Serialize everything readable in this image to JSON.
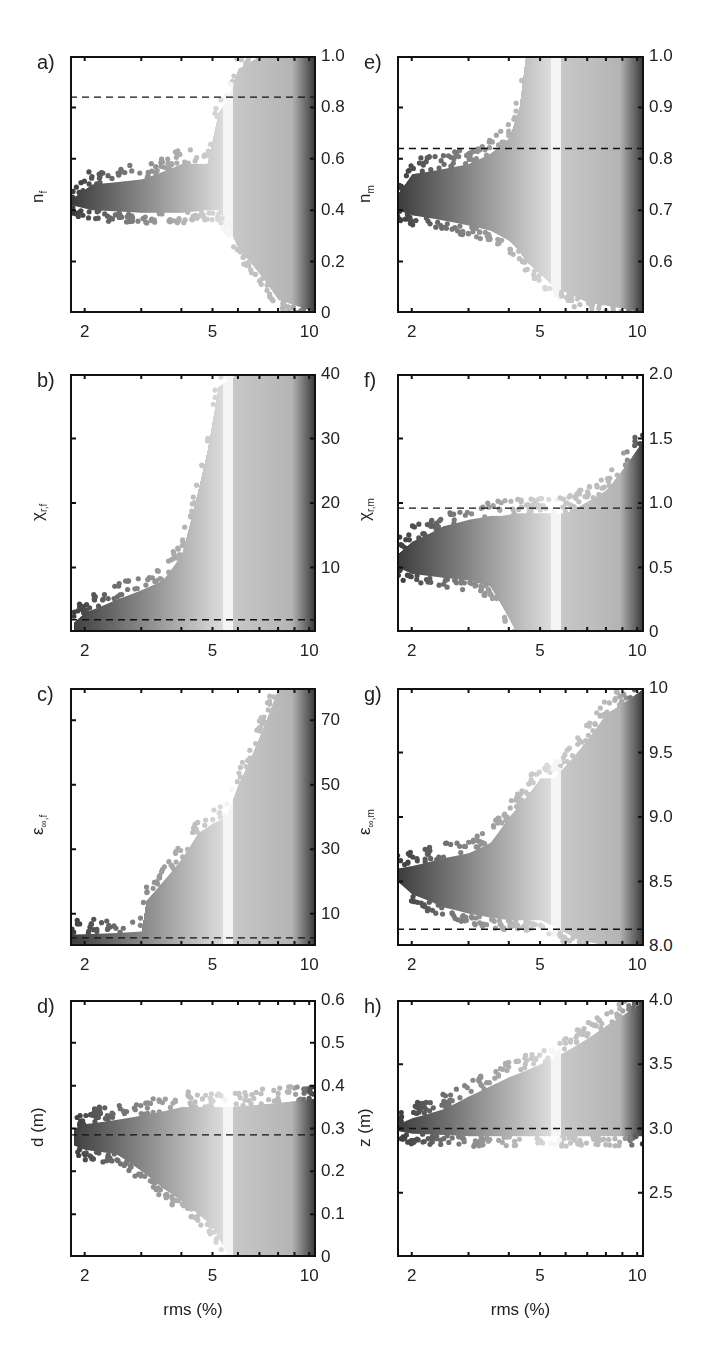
{
  "figure": {
    "xlabel": "rms (%)",
    "x_scale": "log",
    "x_range": [
      1.8,
      10.5
    ],
    "x_ticks": [
      2,
      5,
      10
    ],
    "x_minor_ticks": [
      3,
      4,
      6,
      7,
      8,
      9
    ]
  },
  "chart_data": [
    {
      "id": "a",
      "panel_label": "a)",
      "type": "scatter",
      "ylabel": "n",
      "ylabel_sub": "f",
      "ylim": [
        0,
        1.0
      ],
      "yticks": [
        0,
        0.2,
        0.4,
        0.6,
        0.8,
        1.0
      ],
      "ytick_labels": [
        "0",
        "0.2",
        "0.4",
        "0.6",
        "0.8",
        "1.0"
      ],
      "reference_line": 0.84,
      "xtick_labels": [
        "2",
        "5",
        "10"
      ],
      "envelope": [
        [
          1.8,
          0.42,
          0.44
        ],
        [
          2.1,
          0.4,
          0.5
        ],
        [
          3.0,
          0.39,
          0.52
        ],
        [
          4.0,
          0.39,
          0.58
        ],
        [
          4.8,
          0.4,
          0.58
        ],
        [
          5.2,
          0.4,
          0.78
        ],
        [
          5.5,
          0.35,
          0.82
        ],
        [
          6.0,
          0.25,
          0.95
        ],
        [
          7.0,
          0.15,
          1.0
        ],
        [
          8.0,
          0.05,
          1.0
        ],
        [
          10.5,
          0.0,
          1.0
        ]
      ]
    },
    {
      "id": "b",
      "panel_label": "b)",
      "type": "scatter",
      "ylabel": "χ",
      "ylabel_sub": "r,f",
      "ylim": [
        0,
        40
      ],
      "yticks": [
        10,
        20,
        30,
        40
      ],
      "ytick_labels": [
        "10",
        "20",
        "30",
        "40"
      ],
      "reference_line": 1.9,
      "xtick_labels": [
        "2",
        "5",
        "10"
      ],
      "envelope": [
        [
          1.85,
          0,
          1.5
        ],
        [
          2.0,
          0,
          3
        ],
        [
          2.5,
          0,
          5
        ],
        [
          3.0,
          0,
          6.5
        ],
        [
          3.5,
          0,
          8
        ],
        [
          4.0,
          0,
          12
        ],
        [
          4.3,
          0,
          18
        ],
        [
          4.5,
          0,
          22
        ],
        [
          4.8,
          0,
          28
        ],
        [
          5.2,
          0,
          38
        ],
        [
          6.0,
          0,
          40
        ],
        [
          10.5,
          0,
          40
        ]
      ]
    },
    {
      "id": "c",
      "panel_label": "c)",
      "type": "scatter",
      "ylabel": "ε",
      "ylabel_sub": "∞,f",
      "ylim": [
        0,
        80
      ],
      "yticks": [
        10,
        30,
        50,
        70
      ],
      "ytick_labels": [
        "10",
        "30",
        "50",
        "70"
      ],
      "reference_line": 2.5,
      "xtick_labels": [
        "2",
        "5",
        "10"
      ],
      "envelope": [
        [
          1.8,
          0,
          3.5
        ],
        [
          2.5,
          0,
          4
        ],
        [
          3.0,
          0,
          4.5
        ],
        [
          3.1,
          0,
          14
        ],
        [
          3.5,
          0,
          20
        ],
        [
          4.0,
          0,
          27
        ],
        [
          4.5,
          0,
          35
        ],
        [
          5.0,
          0,
          38
        ],
        [
          5.5,
          0,
          40
        ],
        [
          6.0,
          0,
          50
        ],
        [
          7.0,
          0,
          65
        ],
        [
          8.0,
          0,
          80
        ],
        [
          10.5,
          0,
          80
        ]
      ]
    },
    {
      "id": "d",
      "panel_label": "d)",
      "type": "scatter",
      "ylabel": "d (m)",
      "ylabel_sub": "",
      "ylim": [
        0,
        0.6
      ],
      "yticks": [
        0,
        0.1,
        0.2,
        0.3,
        0.4,
        0.5,
        0.6
      ],
      "ytick_labels": [
        "0",
        "0.1",
        "0.2",
        "0.3",
        "0.4",
        "0.5",
        "0.6"
      ],
      "reference_line": 0.285,
      "xtick_labels": [
        "2",
        "5",
        "10"
      ],
      "envelope": [
        [
          1.85,
          0.26,
          0.3
        ],
        [
          2.0,
          0.25,
          0.31
        ],
        [
          2.5,
          0.24,
          0.32
        ],
        [
          3.0,
          0.2,
          0.33
        ],
        [
          3.5,
          0.16,
          0.34
        ],
        [
          4.0,
          0.13,
          0.35
        ],
        [
          5.0,
          0.07,
          0.35
        ],
        [
          5.6,
          0.0,
          0.35
        ],
        [
          10.5,
          0.0,
          0.37
        ]
      ]
    },
    {
      "id": "e",
      "panel_label": "e)",
      "type": "scatter",
      "ylabel": "n",
      "ylabel_sub": "m",
      "ylim": [
        0.5,
        1.0
      ],
      "yticks": [
        0.6,
        0.7,
        0.8,
        0.9,
        1.0
      ],
      "ytick_labels": [
        "0.6",
        "0.7",
        "0.8",
        "0.9",
        "1.0"
      ],
      "reference_line": 0.82,
      "xtick_labels": [
        "2",
        "5",
        "10"
      ],
      "envelope": [
        [
          1.8,
          0.7,
          0.73
        ],
        [
          2.0,
          0.69,
          0.77
        ],
        [
          2.5,
          0.68,
          0.78
        ],
        [
          3.0,
          0.67,
          0.79
        ],
        [
          3.5,
          0.66,
          0.81
        ],
        [
          4.0,
          0.64,
          0.84
        ],
        [
          4.3,
          0.62,
          0.9
        ],
        [
          4.5,
          0.6,
          1.0
        ],
        [
          5.5,
          0.55,
          1.0
        ],
        [
          7.0,
          0.52,
          1.0
        ],
        [
          10.5,
          0.5,
          1.0
        ]
      ]
    },
    {
      "id": "f",
      "panel_label": "f)",
      "type": "scatter",
      "ylabel": "χ",
      "ylabel_sub": "r,m",
      "ylim": [
        0,
        2.0
      ],
      "yticks": [
        0,
        0.5,
        1.0,
        1.5,
        2.0
      ],
      "ytick_labels": [
        "0",
        "0.5",
        "1.0",
        "1.5",
        "2.0"
      ],
      "reference_line": 0.96,
      "xtick_labels": [
        "2",
        "5",
        "10"
      ],
      "envelope": [
        [
          1.8,
          0.5,
          0.6
        ],
        [
          2.0,
          0.45,
          0.7
        ],
        [
          2.5,
          0.42,
          0.82
        ],
        [
          3.0,
          0.4,
          0.87
        ],
        [
          3.5,
          0.35,
          0.9
        ],
        [
          3.8,
          0.2,
          0.9
        ],
        [
          4.2,
          0.0,
          0.92
        ],
        [
          6.0,
          0.0,
          0.92
        ],
        [
          8.0,
          0.0,
          1.1
        ],
        [
          10.5,
          0.0,
          1.5
        ]
      ]
    },
    {
      "id": "g",
      "panel_label": "g)",
      "type": "scatter",
      "ylabel": "ε",
      "ylabel_sub": "∞,m",
      "ylim": [
        8.0,
        10.0
      ],
      "yticks": [
        8.0,
        8.5,
        9.0,
        9.5,
        10
      ],
      "ytick_labels": [
        "8.0",
        "8.5",
        "9.0",
        "9.5",
        "10"
      ],
      "reference_line": 8.13,
      "xtick_labels": [
        "2",
        "5",
        "10"
      ],
      "envelope": [
        [
          1.8,
          8.5,
          8.6
        ],
        [
          2.0,
          8.4,
          8.62
        ],
        [
          2.5,
          8.3,
          8.68
        ],
        [
          3.0,
          8.25,
          8.72
        ],
        [
          3.5,
          8.22,
          8.8
        ],
        [
          4.0,
          8.2,
          9.0
        ],
        [
          4.5,
          8.2,
          9.15
        ],
        [
          5.0,
          8.2,
          9.3
        ],
        [
          5.5,
          8.15,
          9.3
        ],
        [
          6.5,
          8.05,
          9.5
        ],
        [
          8.0,
          8.0,
          9.8
        ],
        [
          10.5,
          8.0,
          10.0
        ]
      ]
    },
    {
      "id": "h",
      "panel_label": "h)",
      "type": "scatter",
      "ylabel": "z (m)",
      "ylabel_sub": "",
      "ylim": [
        2.0,
        4.0
      ],
      "yticks": [
        2.5,
        3.0,
        3.5,
        4.0
      ],
      "ytick_labels": [
        "2.5",
        "3.0",
        "3.5",
        "4.0"
      ],
      "reference_line": 3.0,
      "xtick_labels": [
        "2",
        "5",
        "10"
      ],
      "xlabel": "rms (%)",
      "envelope": [
        [
          1.8,
          2.98,
          3.03
        ],
        [
          2.0,
          2.96,
          3.08
        ],
        [
          2.5,
          2.95,
          3.15
        ],
        [
          3.0,
          2.94,
          3.25
        ],
        [
          3.5,
          2.94,
          3.33
        ],
        [
          4.0,
          2.94,
          3.4
        ],
        [
          5.0,
          2.94,
          3.5
        ],
        [
          6.0,
          2.94,
          3.6
        ],
        [
          7.0,
          2.94,
          3.7
        ],
        [
          8.0,
          2.94,
          3.8
        ],
        [
          10.5,
          2.94,
          4.0
        ]
      ]
    }
  ],
  "style": {
    "dark_gray": "#3a3a3a",
    "light_gray": "#f4f4f4",
    "frame_color": "#111111",
    "dash_color": "#111111"
  }
}
